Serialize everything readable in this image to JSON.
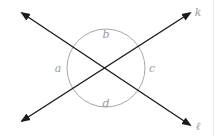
{
  "diagram": {
    "lines": [
      {
        "name": "k",
        "label": "k"
      },
      {
        "name": "l",
        "label": "ℓ"
      }
    ],
    "angles": [
      {
        "name": "a",
        "label": "a",
        "position": "left"
      },
      {
        "name": "b",
        "label": "b",
        "position": "top"
      },
      {
        "name": "c",
        "label": "c",
        "position": "right"
      },
      {
        "name": "d",
        "label": "d",
        "position": "bottom"
      }
    ],
    "colors": {
      "line": "#1a1a1a",
      "arc": "#a8a8a8",
      "label": "#9a9a9a"
    }
  }
}
